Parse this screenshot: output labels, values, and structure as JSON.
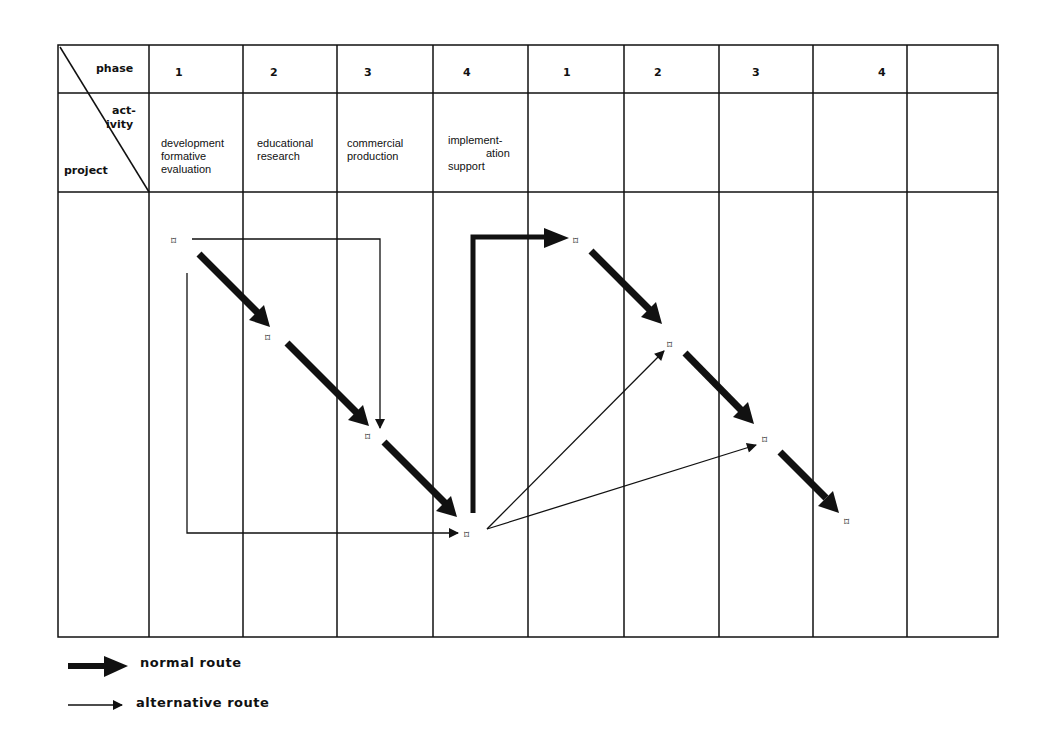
{
  "header": {
    "corner": {
      "phase_label": "phase",
      "activity_label_1": "act-",
      "activity_label_2": "ivity",
      "project_label": "project"
    },
    "phases": [
      "1",
      "2",
      "3",
      "4",
      "1",
      "2",
      "3",
      "4",
      ""
    ],
    "activities": [
      {
        "line1": "development",
        "line2": "formative",
        "line3": "evaluation"
      },
      {
        "line1": "educational",
        "line2": "research",
        "line3": ""
      },
      {
        "line1": "commercial",
        "line2": "production",
        "line3": ""
      },
      {
        "line1": "implement-",
        "line2": "ation",
        "line3": "support"
      }
    ]
  },
  "nodes": [
    {
      "id": "p1",
      "x": 176,
      "y": 241
    },
    {
      "id": "p2",
      "x": 270,
      "y": 338
    },
    {
      "id": "p3",
      "x": 370,
      "y": 437
    },
    {
      "id": "p4",
      "x": 469,
      "y": 535
    },
    {
      "id": "q1",
      "x": 578,
      "y": 241
    },
    {
      "id": "q2",
      "x": 672,
      "y": 345
    },
    {
      "id": "q3",
      "x": 767,
      "y": 440
    },
    {
      "id": "q4",
      "x": 849,
      "y": 522
    }
  ],
  "node_symbol": "⌑",
  "legend": {
    "normal_route": "normal route",
    "alternative_route": "alternative route"
  },
  "colors": {
    "line": "#111111",
    "background": "#ffffff"
  }
}
